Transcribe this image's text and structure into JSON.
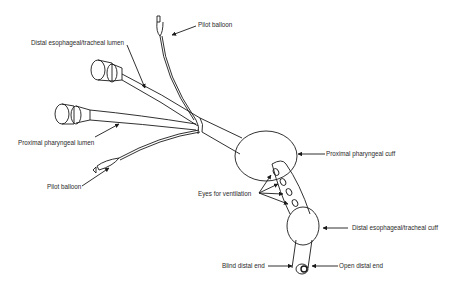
{
  "figure": {
    "labels": {
      "pilot_balloon_top": "Pilot balloon",
      "distal_lumen": "Distal esophageal/tracheal lumen",
      "proximal_lumen": "Proximal pharyngeal lumen",
      "pilot_balloon_bottom": "Pilot balloon",
      "proximal_cuff": "Proximal pharyngeal cuff",
      "eyes": "Eyes for ventilation",
      "distal_cuff": "Distal esophageal/tracheal cuff",
      "blind_end": "Blind distal end",
      "open_end": "Open distal end"
    },
    "colors": {
      "line": "#1a1a1a",
      "text": "#2a2a2a",
      "background": "#ffffff"
    }
  }
}
